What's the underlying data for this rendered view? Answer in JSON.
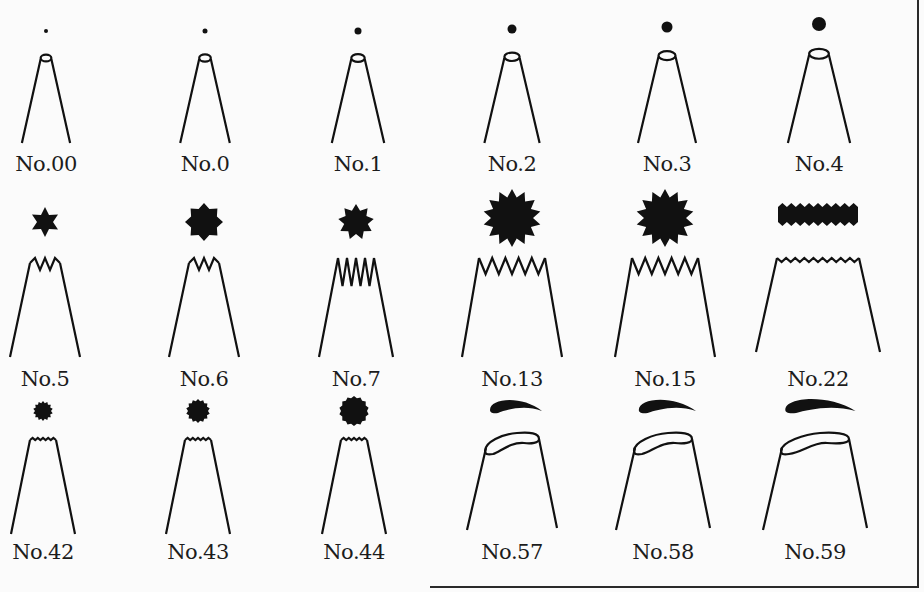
{
  "colors": {
    "ink": "#111111",
    "background": "#fbfbfb",
    "frame": "#2a2a2a"
  },
  "rows": [
    {
      "type": "round",
      "tips": [
        {
          "label": "No.00",
          "cx": 46,
          "shape": "dot",
          "size": 3
        },
        {
          "label": "No.0",
          "cx": 205,
          "shape": "dot",
          "size": 4
        },
        {
          "label": "No.1",
          "cx": 358,
          "shape": "dot",
          "size": 6
        },
        {
          "label": "No.2",
          "cx": 512,
          "shape": "dot",
          "size": 8
        },
        {
          "label": "No.3",
          "cx": 667,
          "shape": "dot",
          "size": 10
        },
        {
          "label": "No.4",
          "cx": 819,
          "shape": "dot",
          "size": 13
        }
      ]
    },
    {
      "type": "star",
      "tips": [
        {
          "label": "No.5",
          "cx": 45,
          "shape": "star",
          "points": 6
        },
        {
          "label": "No.6",
          "cx": 204,
          "shape": "star",
          "points": 8
        },
        {
          "label": "No.7",
          "cx": 356,
          "shape": "star",
          "points": 9
        },
        {
          "label": "No.13",
          "cx": 512,
          "shape": "star",
          "points": 14
        },
        {
          "label": "No.15",
          "cx": 665,
          "shape": "star",
          "points": 14
        },
        {
          "label": "No.22",
          "cx": 818,
          "shape": "ribbon"
        }
      ]
    },
    {
      "type": "small-star-and-petal",
      "tips": [
        {
          "label": "No.42",
          "cx": 43,
          "shape": "serrated-dot",
          "size": 10
        },
        {
          "label": "No.43",
          "cx": 198,
          "shape": "serrated-dot",
          "size": 12
        },
        {
          "label": "No.44",
          "cx": 354,
          "shape": "serrated-dot",
          "size": 15
        },
        {
          "label": "No.57",
          "cx": 512,
          "shape": "petal",
          "scale": 1.0
        },
        {
          "label": "No.58",
          "cx": 663,
          "shape": "petal",
          "scale": 1.1
        },
        {
          "label": "No.59",
          "cx": 815,
          "shape": "petal",
          "scale": 1.35
        }
      ]
    }
  ]
}
